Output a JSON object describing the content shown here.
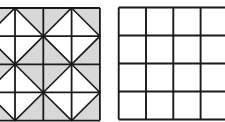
{
  "canvas": {
    "width": 225,
    "height": 122,
    "background": "#ffffff"
  },
  "figures": {
    "left_quilt": {
      "name": "quilt-grid-figure",
      "type": "diagonal-quilt-grid",
      "grid": {
        "cols": 4,
        "rows": 4,
        "origin_x": -13.3,
        "origin_y": 8.0,
        "col_step": 28.3,
        "row_step": 28.15
      },
      "clipped_side": "left",
      "shaded_fill": "#d8d8d8",
      "diamond_fill": "#ffffff",
      "line_color": "#1a1a1a",
      "grid_line_width": 1.8,
      "diagonal_line_width": 1.6,
      "white_diamond_centers": [
        [
          1,
          1
        ],
        [
          3,
          1
        ],
        [
          1,
          3
        ],
        [
          3,
          3
        ]
      ]
    },
    "right_blank": {
      "name": "blank-grid-figure",
      "type": "plain-grid",
      "grid": {
        "cols": 4,
        "rows": 4,
        "origin_x": 118.7,
        "origin_y": 7.5,
        "col_step": 27.3,
        "row_step": 28.0
      },
      "clipped_side": "right",
      "cell_fill": "#ffffff",
      "line_color": "#1a1a1a",
      "grid_line_width": 1.9
    }
  }
}
